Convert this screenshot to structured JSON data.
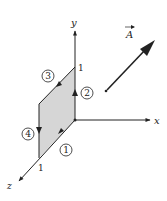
{
  "diagram": {
    "type": "3d-coordinate-system-with-closed-loop",
    "axes": {
      "x": {
        "label": "x",
        "tick": "1"
      },
      "y": {
        "label": "y",
        "tick": "1"
      },
      "z": {
        "label": "z",
        "tick": "1"
      }
    },
    "surface": {
      "plane": "yz",
      "fill": "#d6d6d6",
      "description": "unit square in yz-plane"
    },
    "path_segments": [
      {
        "id": "1",
        "label": "1",
        "edge": "along z-axis toward origin"
      },
      {
        "id": "2",
        "label": "2",
        "edge": "along y-axis upward"
      },
      {
        "id": "3",
        "label": "3",
        "edge": "top edge toward +z"
      },
      {
        "id": "4",
        "label": "4",
        "edge": "left edge downward"
      }
    ],
    "vector_field": {
      "label": "A",
      "decoration": "arrow-over",
      "direction": "diagonal up-right"
    },
    "colors": {
      "ink": "#222222",
      "surface": "#d6d6d6",
      "background": "#ffffff"
    }
  }
}
